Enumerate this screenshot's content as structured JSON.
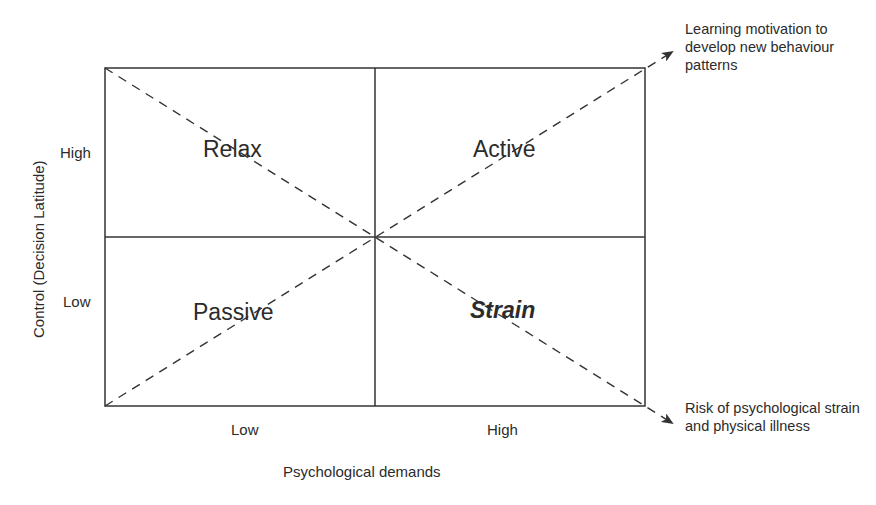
{
  "diagram": {
    "quadrants": {
      "top_left": "Relax",
      "top_right": "Active",
      "bottom_left": "Passive",
      "bottom_right": "Strain"
    },
    "x_axis": {
      "label": "Psychological demands",
      "ticks": [
        "Low",
        "High"
      ]
    },
    "y_axis": {
      "label": "Control (Decision Latitude)",
      "ticks": [
        "High",
        "Low"
      ]
    },
    "arrows": {
      "upper": "Learning motivation to develop new behaviour patterns",
      "lower": "Risk of psychological strain and physical illness"
    },
    "colors": {
      "line": "#333333",
      "text": "#2b2b2b",
      "background": "#ffffff"
    }
  }
}
